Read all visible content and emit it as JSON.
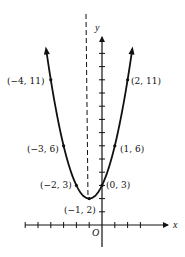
{
  "figure": {
    "function": "y = x^2 + 2x + 3",
    "axis_of_symmetry": "x = -1",
    "axes": {
      "x_label": "x",
      "y_label": "y",
      "origin_label": "O"
    },
    "x_ticks": [
      -6,
      -5,
      -4,
      -3,
      -2,
      -1,
      1,
      2,
      3
    ],
    "y_ticks": [
      1,
      2,
      3,
      4,
      5,
      6,
      7,
      8,
      9,
      10,
      11,
      12,
      13
    ],
    "points": [
      {
        "x": -4,
        "y": 11,
        "label": "(−4, 11)"
      },
      {
        "x": 2,
        "y": 11,
        "label": "(2, 11)"
      },
      {
        "x": -3,
        "y": 6,
        "label": "(−3, 6)"
      },
      {
        "x": 1,
        "y": 6,
        "label": "(1, 6)"
      },
      {
        "x": -2,
        "y": 3,
        "label": "(−2, 3)"
      },
      {
        "x": 0,
        "y": 3,
        "label": "(0, 3)"
      },
      {
        "x": -1,
        "y": 2,
        "label": "(−1, 2)"
      }
    ],
    "colors": {
      "ink": "#111111",
      "background": "#ffffff"
    }
  }
}
